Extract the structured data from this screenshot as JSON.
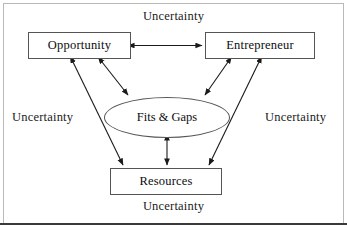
{
  "diagram": {
    "title_visible": false,
    "colors": {
      "background": "#ffffff",
      "outer_frame_border": "#b9b9b9",
      "bottom_rule": "#3a3a3a",
      "node_border": "#555555",
      "arrow": "#1a1a1a",
      "text": "#0d0d0d"
    },
    "nodes": {
      "opportunity": {
        "label": "Opportunity",
        "shape": "rectangle"
      },
      "entrepreneur": {
        "label": "Entrepreneur",
        "shape": "rectangle"
      },
      "fits_gaps": {
        "label": "Fits & Gaps",
        "shape": "ellipse"
      },
      "resources": {
        "label": "Resources",
        "shape": "rectangle"
      }
    },
    "environment_labels": {
      "top": "Uncertainty",
      "left": "Uncertainty",
      "right": "Uncertainty",
      "bottom": "Uncertainty"
    },
    "connectors": [
      {
        "from": "opportunity",
        "to": "entrepreneur",
        "style": "double-headed-arrow",
        "orientation": "horizontal"
      },
      {
        "from": "opportunity",
        "to": "fits_gaps",
        "style": "double-headed-arrow",
        "orientation": "diagonal"
      },
      {
        "from": "entrepreneur",
        "to": "fits_gaps",
        "style": "double-headed-arrow",
        "orientation": "diagonal"
      },
      {
        "from": "opportunity",
        "to": "resources",
        "style": "double-headed-arrow",
        "orientation": "diagonal"
      },
      {
        "from": "entrepreneur",
        "to": "resources",
        "style": "double-headed-arrow",
        "orientation": "diagonal"
      },
      {
        "from": "fits_gaps",
        "to": "resources",
        "style": "double-headed-arrow",
        "orientation": "vertical"
      }
    ]
  }
}
